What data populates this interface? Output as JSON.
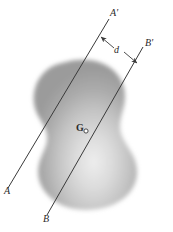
{
  "figure": {
    "name": "parallel-axes-through-centroid",
    "background_color": "#ffffff",
    "width": 173,
    "height": 232,
    "labels": {
      "axis_a_start": "A",
      "axis_a_end": "A'",
      "axis_b_start": "B",
      "axis_b_end": "B'",
      "distance": "d",
      "centroid": "G"
    },
    "colors": {
      "line": "#3a3a3a",
      "label": "#2a2a2a",
      "body_dark": "#9a9a9a",
      "body_mid": "#b5b5b5",
      "body_light": "#e8e8e8"
    },
    "geometry": {
      "axis_a": {
        "x1": 8,
        "y1": 188,
        "x2": 109,
        "y2": 19
      },
      "axis_b": {
        "x1": 47,
        "y1": 215,
        "x2": 143,
        "y2": 47
      },
      "centroid_point": {
        "x": 86,
        "y": 131
      },
      "centroid_radius": 2.1,
      "distance_leader": {
        "label_x": 117,
        "label_y": 50,
        "arrow1_from": {
          "x": 114,
          "y": 48
        },
        "arrow1_to": {
          "x": 101,
          "y": 37
        },
        "arrow2_from": {
          "x": 124,
          "y": 52
        },
        "arrow2_to": {
          "x": 137,
          "y": 63
        }
      },
      "label_positions": {
        "axis_a_start": {
          "x": 4,
          "y": 186
        },
        "axis_a_end": {
          "x": 110,
          "y": 8
        },
        "axis_b_start": {
          "x": 43,
          "y": 214
        },
        "axis_b_end": {
          "x": 145,
          "y": 38
        },
        "distance": {
          "x": 114,
          "y": 45
        },
        "centroid": {
          "x": 76,
          "y": 123
        }
      }
    }
  }
}
